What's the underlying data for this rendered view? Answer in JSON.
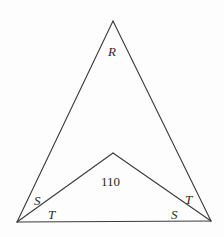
{
  "diagram": {
    "vertices": {
      "apex": {
        "x": 113,
        "y": 21
      },
      "bottom_left": {
        "x": 17,
        "y": 222
      },
      "bottom_right": {
        "x": 211,
        "y": 221
      },
      "inner": {
        "x": 113,
        "y": 153
      }
    },
    "labels": {
      "apex_angle": "R",
      "inner_angle": "110",
      "left_upper_angle": "S",
      "left_lower_angle": "T",
      "right_upper_angle": "T",
      "right_lower_angle": "S"
    },
    "colors": {
      "stroke": "#3a3a3a",
      "text": "#2a2a2a",
      "background": "#fdfdfd"
    }
  }
}
